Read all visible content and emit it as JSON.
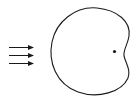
{
  "diagram": {
    "arrows": {
      "count": 3,
      "direction": "right"
    },
    "body": {
      "shape": "closed-curve-bean",
      "concave_side": "right"
    },
    "point": {
      "label": ""
    },
    "colors": {
      "stroke": "#1a1a1a",
      "background": "#ffffff"
    }
  }
}
